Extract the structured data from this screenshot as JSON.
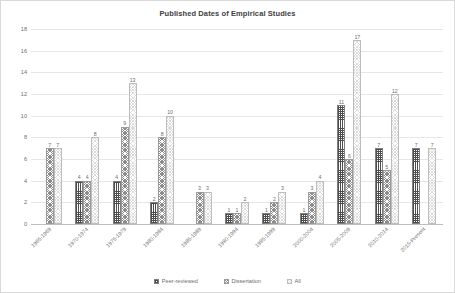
{
  "chart_data": {
    "type": "bar",
    "title": "Published Dates of Empirical Studies",
    "xlabel": "",
    "ylabel": "",
    "ylim": [
      0,
      18
    ],
    "yticks": [
      0,
      2,
      4,
      6,
      8,
      10,
      12,
      14,
      16,
      18
    ],
    "grid": true,
    "legend_position": "bottom",
    "categories": [
      "1965-1969",
      "1970-1974",
      "1975-1979",
      "1980-1984",
      "1985-1989",
      "1990-1994",
      "1995-1999",
      "2000-2004",
      "2005-2009",
      "2010-2014",
      "2015-Present"
    ],
    "series": [
      {
        "name": "Peer-reviewed",
        "pattern": "dark-crosshatch",
        "values": [
          null,
          4,
          4,
          2,
          null,
          1,
          1,
          1,
          11,
          7,
          7
        ]
      },
      {
        "name": "Dissertation",
        "pattern": "medium-crosshatch",
        "values": [
          7,
          4,
          9,
          8,
          3,
          1,
          2,
          3,
          6,
          5,
          null
        ]
      },
      {
        "name": "All",
        "pattern": "light-crosshatch",
        "values": [
          7,
          8,
          13,
          10,
          3,
          2,
          3,
          4,
          17,
          12,
          7
        ]
      }
    ]
  },
  "legend": {
    "items": [
      {
        "label": "Peer-reviewed"
      },
      {
        "label": "Dissertation"
      },
      {
        "label": "All"
      }
    ]
  }
}
